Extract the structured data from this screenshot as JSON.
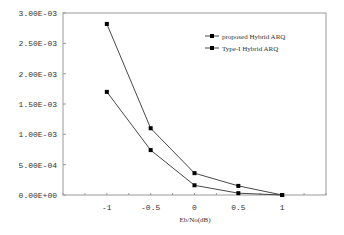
{
  "chart_data": {
    "type": "line",
    "title": "",
    "xlabel": "Eb/No(dB)",
    "ylabel": "",
    "x": [
      -1,
      -0.5,
      0,
      0.5,
      1
    ],
    "xlim": [
      -1.5,
      1.5
    ],
    "ylim": [
      0,
      0.003
    ],
    "x_ticks": [
      "-1",
      "-0.5",
      "0",
      "0.5",
      "1"
    ],
    "y_ticks": [
      "0.00E+00",
      "5.00E-04",
      "1.00E-03",
      "1.50E-03",
      "2.00E-03",
      "2.50E-03",
      "3.00E-03"
    ],
    "grid": false,
    "legend_position": "upper right",
    "series": [
      {
        "name": "proposed Hybrid ARQ",
        "marker": "square",
        "values": [
          0.0017,
          0.00074,
          0.00016,
          3e-05,
          0.0
        ]
      },
      {
        "name": "Type-I Hybrid ARQ",
        "marker": "square",
        "values": [
          0.00282,
          0.0011,
          0.00036,
          0.00015,
          0.0
        ]
      }
    ]
  },
  "colors": {
    "line": "#333333",
    "axis": "#888888",
    "background": "#ffffff"
  }
}
